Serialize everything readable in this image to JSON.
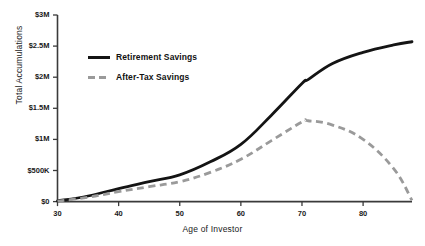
{
  "chart_data": {
    "type": "line",
    "title": "",
    "xlabel": "Age of Investor",
    "ylabel": "Total Accumulations",
    "xlim": [
      30,
      88
    ],
    "ylim": [
      0,
      3000000
    ],
    "grid": false,
    "legend_position": "upper-left-inside",
    "xticks": [
      30,
      40,
      50,
      60,
      70,
      80
    ],
    "xtick_labels": [
      "30",
      "40",
      "50",
      "60",
      "70",
      "80"
    ],
    "yticks": [
      0,
      500000,
      1000000,
      1500000,
      2000000,
      2500000,
      3000000
    ],
    "ytick_labels": [
      "$0",
      "$500K",
      "$1M",
      "$1.5M",
      "$2M",
      "$2.5M",
      "$3M"
    ],
    "x": [
      30,
      35,
      40,
      45,
      50,
      55,
      60,
      65,
      70,
      71,
      75,
      80,
      85,
      88
    ],
    "series": [
      {
        "name": "Retirement Savings",
        "color": "#141414",
        "style": "solid",
        "values": [
          10000,
          90000,
          210000,
          320000,
          430000,
          640000,
          920000,
          1390000,
          1900000,
          1960000,
          2220000,
          2400000,
          2520000,
          2570000
        ]
      },
      {
        "name": "After-Tax Savings",
        "color": "#9a9a9a",
        "style": "dashed",
        "values": [
          8000,
          70000,
          160000,
          240000,
          320000,
          470000,
          680000,
          980000,
          1280000,
          1300000,
          1230000,
          1000000,
          530000,
          20000
        ]
      }
    ]
  },
  "axis": {
    "ylabel": "Total Accumulations",
    "xlabel": "Age of Investor"
  },
  "legend": {
    "items": [
      {
        "label": "Retirement Savings",
        "style": "solid",
        "color": "#141414"
      },
      {
        "label": "After-Tax Savings",
        "style": "dashed",
        "color": "#9a9a9a"
      }
    ]
  },
  "colors": {
    "axis": "#3a3a3a",
    "retirement": "#141414",
    "after_tax": "#9a9a9a",
    "text": "#1a1a1a",
    "background": "#ffffff"
  }
}
